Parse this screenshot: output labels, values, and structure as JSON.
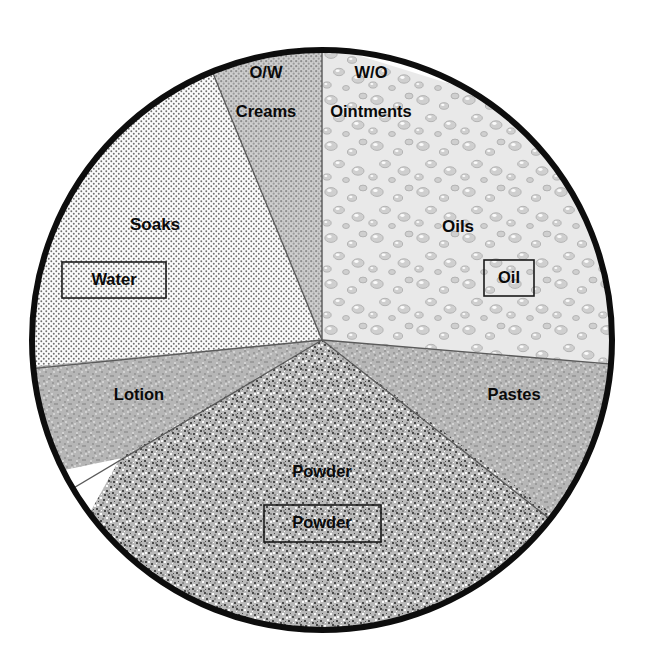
{
  "figure": {
    "kind": "dermatologic-vehicle-wheel",
    "shape": "circle",
    "center": {
      "x": 322,
      "y": 340
    },
    "radius": 292,
    "outline_color": "#0d0d0d",
    "divider_color": "#5a5a5a",
    "text_color": "#0a0a0a",
    "background_color": "#ffffff"
  },
  "sectors": [
    {
      "id": "soaks",
      "name": "Soaks",
      "label": "Soaks",
      "label_pos": {
        "x": 155,
        "y": 224
      },
      "fill_pattern": "fine-dot-stipple",
      "fill_color": "#f7f7f7",
      "start_angle": 187,
      "end_angle": 261
    },
    {
      "id": "creams",
      "name": "Creams",
      "label": "Creams",
      "sublabel": "O/W",
      "sublabel_pos": {
        "x": 266,
        "y": 72
      },
      "label_pos": {
        "x": 266,
        "y": 111
      },
      "fill_pattern": "medium-dot-stipple",
      "fill_color": "#c8c8c8",
      "start_angle": 261,
      "end_angle": 270
    },
    {
      "id": "ointments",
      "name": "Ointments",
      "label": "Ointments",
      "sublabel": "W/O",
      "sublabel_pos": {
        "x": 370,
        "y": 72
      },
      "label_pos": {
        "x": 370,
        "y": 111
      },
      "fill_pattern": "droplet-texture",
      "fill_color": "#e8e8e8",
      "start_angle": 270,
      "end_angle": 300
    },
    {
      "id": "oils",
      "name": "Oils",
      "label": "Oils",
      "label_pos": {
        "x": 458,
        "y": 226
      },
      "fill_pattern": "droplet-texture",
      "fill_color": "#e8e8e8",
      "start_angle": 300,
      "end_angle": 5
    },
    {
      "id": "pastes",
      "name": "Pastes",
      "label": "Pastes",
      "label_pos": {
        "x": 513,
        "y": 394
      },
      "fill_pattern": "coarse-grain",
      "fill_color": "#b4b4b4",
      "start_angle": 5,
      "end_angle": 33
    },
    {
      "id": "powder",
      "name": "Powder",
      "label": "Powder",
      "label_pos": {
        "x": 322,
        "y": 472
      },
      "fill_pattern": "speckle-noise",
      "fill_color": "#a8a8a8",
      "start_angle": 33
    },
    {
      "id": "lotion",
      "name": "Lotion",
      "label": "Lotion",
      "label_pos": {
        "x": 140,
        "y": 394
      },
      "fill_pattern": "coarse-grain",
      "fill_color": "#b0b0b0",
      "start_angle": 150,
      "end_angle": 187
    }
  ],
  "boxed_labels": [
    {
      "id": "water",
      "label": "Water",
      "box": {
        "x": 62,
        "y": 262,
        "width": 104,
        "height": 36
      },
      "text_pos": {
        "x": 114,
        "y": 280
      }
    },
    {
      "id": "oil",
      "label": "Oil",
      "box": {
        "x": 484,
        "y": 260,
        "width": 50,
        "height": 36
      },
      "text_pos": {
        "x": 509,
        "y": 278
      }
    },
    {
      "id": "powder",
      "label": "Powder",
      "box": {
        "x": 264,
        "y": 505,
        "width": 117,
        "height": 37
      },
      "text_pos": {
        "x": 322,
        "y": 523
      }
    }
  ]
}
